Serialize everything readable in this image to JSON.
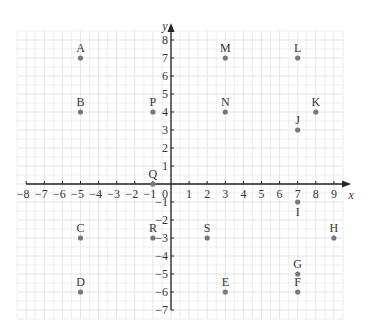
{
  "chart_data": {
    "type": "scatter",
    "title": "",
    "xlabel": "x",
    "ylabel": "y",
    "xlim": [
      -8,
      9
    ],
    "ylim": [
      -7,
      8
    ],
    "grid": true,
    "x_ticks": [
      -8,
      -7,
      -6,
      -5,
      -4,
      -3,
      -2,
      -1,
      0,
      1,
      2,
      3,
      4,
      5,
      6,
      7,
      8,
      9
    ],
    "y_ticks": [
      -7,
      -6,
      -5,
      -4,
      -3,
      -2,
      -1,
      1,
      2,
      3,
      4,
      5,
      6,
      7,
      8
    ],
    "origin_label": "0",
    "points": [
      {
        "label": "A",
        "x": -5,
        "y": 7,
        "label_pos": "above"
      },
      {
        "label": "B",
        "x": -5,
        "y": 4,
        "label_pos": "above"
      },
      {
        "label": "C",
        "x": -5,
        "y": -3,
        "label_pos": "above"
      },
      {
        "label": "D",
        "x": -5,
        "y": -6,
        "label_pos": "above"
      },
      {
        "label": "E",
        "x": 3,
        "y": -6,
        "label_pos": "above"
      },
      {
        "label": "F",
        "x": 7,
        "y": -6,
        "label_pos": "above"
      },
      {
        "label": "G",
        "x": 7,
        "y": -5,
        "label_pos": "above"
      },
      {
        "label": "H",
        "x": 9,
        "y": -3,
        "label_pos": "above"
      },
      {
        "label": "I",
        "x": 7,
        "y": -1,
        "label_pos": "below"
      },
      {
        "label": "J",
        "x": 7,
        "y": 3,
        "label_pos": "above"
      },
      {
        "label": "K",
        "x": 8,
        "y": 4,
        "label_pos": "above"
      },
      {
        "label": "L",
        "x": 7,
        "y": 7,
        "label_pos": "above"
      },
      {
        "label": "M",
        "x": 3,
        "y": 7,
        "label_pos": "above"
      },
      {
        "label": "N",
        "x": 3,
        "y": 4,
        "label_pos": "above"
      },
      {
        "label": "P",
        "x": -1,
        "y": 4,
        "label_pos": "above"
      },
      {
        "label": "Q",
        "x": -1,
        "y": 0,
        "label_pos": "above"
      },
      {
        "label": "R",
        "x": -1,
        "y": -3,
        "label_pos": "above"
      },
      {
        "label": "S",
        "x": 2,
        "y": -3,
        "label_pos": "above"
      }
    ],
    "colors": {
      "grid": "#e2e2e2",
      "axis": "#222222",
      "point": "#777777",
      "text": "#333333"
    }
  }
}
